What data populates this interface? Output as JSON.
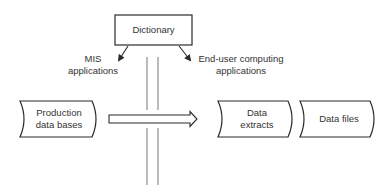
{
  "diagram": {
    "nodes": {
      "dictionary": {
        "label": "Dictionary",
        "shape": "rectangle"
      },
      "production_data_bases": {
        "line1": "Production",
        "line2": "data bases",
        "shape": "stored-data"
      },
      "data_extracts": {
        "line1": "Data",
        "line2": "extracts",
        "shape": "stored-data"
      },
      "data_files": {
        "label": "Data files",
        "shape": "stored-data"
      }
    },
    "labels": {
      "mis_applications": {
        "line1": "MIS",
        "line2": "applications"
      },
      "end_user_applications": {
        "line1": "End-user computing",
        "line2": "applications"
      }
    },
    "edges": [
      {
        "from": "dictionary",
        "to": "mis_applications",
        "style": "arrow"
      },
      {
        "from": "dictionary",
        "to": "end_user_applications",
        "style": "arrow"
      },
      {
        "from": "production_data_bases",
        "to": "data_extracts",
        "style": "hollow-arrow",
        "crosses": "boundary"
      }
    ],
    "boundary": {
      "style": "double-vertical-line"
    },
    "colors": {
      "stroke": "#2a2a2a",
      "background": "#ffffff",
      "text": "#333333"
    }
  }
}
